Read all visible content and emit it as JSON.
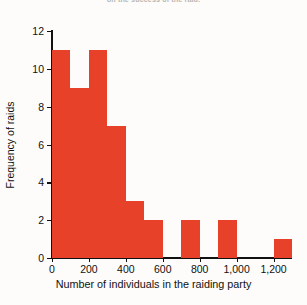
{
  "caption": {
    "fragment": "on the success of the raid."
  },
  "chart_data": {
    "type": "bar",
    "title": "",
    "subtitle": "",
    "xlabel": "Number of individuals in the raiding party",
    "ylabel": "Frequency of raids",
    "grid": false,
    "legend": null,
    "bar_color": "#e8412a",
    "axis_color": "#111111",
    "background": "#fdfcfa",
    "bin_width": 100,
    "xlim": [
      0,
      1300
    ],
    "ylim": [
      0,
      12
    ],
    "xticks": [
      0,
      200,
      400,
      600,
      800,
      1000,
      1200
    ],
    "xtick_labels": [
      "0",
      "200",
      "400",
      "600",
      "800",
      "1,000",
      "1,200"
    ],
    "yticks": [
      0,
      2,
      4,
      6,
      8,
      10,
      12
    ],
    "ytick_labels": [
      "0",
      "2",
      "4",
      "6",
      "8",
      "10",
      "12"
    ],
    "categories": [
      "0-100",
      "100-200",
      "200-300",
      "300-400",
      "400-500",
      "500-600",
      "600-700",
      "700-800",
      "800-900",
      "900-1,000",
      "1,000-1,100",
      "1,100-1,200",
      "1,200-1,300"
    ],
    "values": [
      11,
      9,
      11,
      7,
      3,
      2,
      0,
      2,
      0,
      2,
      0,
      0,
      1
    ],
    "bins": [
      {
        "start": 0,
        "end": 100,
        "value": 11
      },
      {
        "start": 100,
        "end": 200,
        "value": 9
      },
      {
        "start": 200,
        "end": 300,
        "value": 11
      },
      {
        "start": 300,
        "end": 400,
        "value": 7
      },
      {
        "start": 400,
        "end": 500,
        "value": 3
      },
      {
        "start": 500,
        "end": 600,
        "value": 2
      },
      {
        "start": 600,
        "end": 700,
        "value": 0
      },
      {
        "start": 700,
        "end": 800,
        "value": 2
      },
      {
        "start": 800,
        "end": 900,
        "value": 0
      },
      {
        "start": 900,
        "end": 1000,
        "value": 2
      },
      {
        "start": 1000,
        "end": 1100,
        "value": 0
      },
      {
        "start": 1100,
        "end": 1200,
        "value": 0
      },
      {
        "start": 1200,
        "end": 1300,
        "value": 1
      }
    ]
  }
}
